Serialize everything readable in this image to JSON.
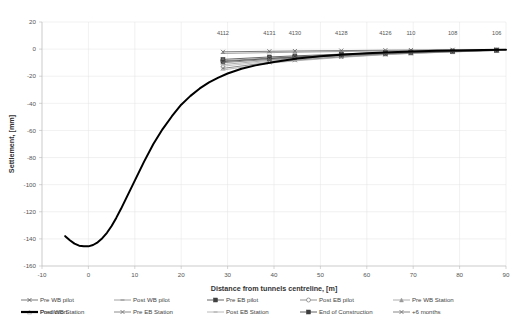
{
  "chart_data": {
    "type": "line",
    "title": "",
    "xlabel": "Distance from tunnels centreline, [m]",
    "ylabel": "Settlement, [mm]",
    "xlim": [
      -10,
      90
    ],
    "ylim": [
      -160,
      20
    ],
    "xticks": [
      -10,
      0,
      10,
      20,
      30,
      40,
      50,
      60,
      70,
      80,
      90
    ],
    "yticks": [
      20,
      0,
      -20,
      -40,
      -60,
      -80,
      -100,
      -120,
      -140,
      -160
    ],
    "grid": true,
    "legend_position": "bottom",
    "point_labels": [
      {
        "text": "4112",
        "x": 29.0
      },
      {
        "text": "4131",
        "x": 39.0
      },
      {
        "text": "4130",
        "x": 44.5
      },
      {
        "text": "4128",
        "x": 54.5
      },
      {
        "text": "4126",
        "x": 64.0
      },
      {
        "text": "110",
        "x": 69.5
      },
      {
        "text": "108",
        "x": 78.5
      },
      {
        "text": "106",
        "x": 88.0
      }
    ],
    "series": [
      {
        "name": "Pre WB pilot",
        "color": "#595959",
        "marker": "cross",
        "x": [
          29.0,
          39.0,
          44.5,
          54.5,
          64.0,
          69.5,
          78.5,
          88.0
        ],
        "values": [
          -2.0,
          -1.6,
          -1.4,
          -1.1,
          -0.8,
          -0.7,
          -0.5,
          -0.3
        ]
      },
      {
        "name": "Post WB pilot",
        "color": "#8c8c8c",
        "marker": "dash",
        "x": [
          29.0,
          39.0,
          44.5,
          54.5,
          64.0,
          69.5,
          78.5,
          88.0
        ],
        "values": [
          -3.2,
          -2.6,
          -2.3,
          -1.8,
          -1.3,
          -1.1,
          -0.8,
          -0.4
        ]
      },
      {
        "name": "Pre EB pilot",
        "color": "#404040",
        "marker": "square",
        "x": [
          29.0,
          39.0,
          44.5,
          54.5,
          64.0,
          69.5,
          78.5,
          88.0
        ],
        "values": [
          -7.6,
          -5.8,
          -5.0,
          -3.7,
          -2.6,
          -2.1,
          -1.4,
          -0.7
        ]
      },
      {
        "name": "Post EB pilot",
        "color": "#7a7a7a",
        "marker": "circle-open",
        "x": [
          29.0,
          39.0,
          44.5,
          54.5,
          64.0,
          69.5,
          78.5,
          88.0
        ],
        "values": [
          -8.6,
          -6.6,
          -5.7,
          -4.2,
          -3.0,
          -2.4,
          -1.6,
          -0.8
        ]
      },
      {
        "name": "Pre WB Station",
        "color": "#9a9a9a",
        "marker": "tri",
        "x": [
          29.0,
          39.0,
          44.5,
          54.5,
          64.0,
          69.5,
          78.5,
          88.0
        ],
        "values": [
          -11.4,
          -8.3,
          -7.0,
          -5.0,
          -3.4,
          -2.7,
          -1.8,
          -0.9
        ]
      },
      {
        "name": "Post WB Station",
        "color": "#b5b5b5",
        "marker": "tri-open",
        "x": [
          29.0,
          39.0,
          44.5,
          54.5,
          64.0,
          69.5,
          78.5,
          88.0
        ],
        "values": [
          -12.6,
          -9.0,
          -7.6,
          -5.4,
          -3.7,
          -2.9,
          -1.9,
          -0.9
        ]
      },
      {
        "name": "Pre EB Station",
        "color": "#6e6e6e",
        "marker": "cross",
        "x": [
          29.0,
          39.0,
          44.5,
          54.5,
          64.0,
          69.5,
          78.5,
          88.0
        ],
        "values": [
          -14.2,
          -9.8,
          -8.2,
          -5.8,
          -3.9,
          -3.1,
          -2.0,
          -1.0
        ]
      },
      {
        "name": "Post EB Station",
        "color": "#a8a8a8",
        "marker": "dash",
        "x": [
          29.0,
          39.0,
          44.5,
          54.5,
          64.0,
          69.5,
          78.5,
          88.0
        ],
        "values": [
          -15.4,
          -10.4,
          -8.7,
          -6.1,
          -4.1,
          -3.2,
          -2.1,
          -1.0
        ]
      },
      {
        "name": "End of Construction",
        "color": "#3d3d3d",
        "marker": "square",
        "x": [
          29.0,
          39.0,
          44.5,
          54.5,
          64.0,
          69.5,
          78.5,
          88.0
        ],
        "values": [
          -9.2,
          -7.0,
          -6.0,
          -4.4,
          -3.1,
          -2.5,
          -1.6,
          -0.8
        ]
      },
      {
        "name": "+6 months",
        "color": "#6b6b6b",
        "marker": "cross",
        "x": [
          29.0,
          39.0,
          44.5,
          54.5,
          64.0,
          69.5,
          78.5,
          88.0
        ],
        "values": [
          -10.0,
          -7.6,
          -6.5,
          -4.7,
          -3.3,
          -2.6,
          -1.7,
          -0.8
        ]
      },
      {
        "name": "Prediction",
        "color": "#000000",
        "marker": "none",
        "width": 2.0,
        "x": [
          -5,
          -4,
          -3,
          -2,
          -1,
          0,
          1,
          2,
          3,
          4,
          5,
          6,
          7,
          8,
          9,
          10,
          12,
          14,
          16,
          18,
          20,
          22,
          24,
          26,
          28,
          30,
          33,
          36,
          40,
          45,
          50,
          55,
          60,
          65,
          70,
          75,
          80,
          85,
          90
        ],
        "values": [
          -138,
          -141,
          -143.5,
          -145,
          -145.5,
          -145.5,
          -144.5,
          -142.5,
          -139.5,
          -135.5,
          -130.5,
          -124.5,
          -118,
          -111,
          -104,
          -97,
          -83,
          -70,
          -59,
          -49.5,
          -41,
          -34.5,
          -29,
          -24.5,
          -21,
          -18,
          -14.5,
          -12,
          -9.5,
          -7,
          -5.2,
          -4,
          -3,
          -2.3,
          -1.8,
          -1.3,
          -1,
          -0.7,
          -0.4
        ]
      }
    ],
    "legend": [
      {
        "label": "Pre WB pilot",
        "color": "#595959",
        "marker": "cross"
      },
      {
        "label": "Post WB pilot",
        "color": "#8c8c8c",
        "marker": "dash"
      },
      {
        "label": "Pre EB pilot",
        "color": "#404040",
        "marker": "square"
      },
      {
        "label": "Post EB pilot",
        "color": "#7a7a7a",
        "marker": "circle-open"
      },
      {
        "label": "Pre WB Station",
        "color": "#9a9a9a",
        "marker": "tri"
      },
      {
        "label": "Post WB Station",
        "color": "#b5b5b5",
        "marker": "tri-open"
      },
      {
        "label": "Pre EB Station",
        "color": "#6e6e6e",
        "marker": "cross"
      },
      {
        "label": "Post EB Station",
        "color": "#a8a8a8",
        "marker": "dash"
      },
      {
        "label": "End of Construction",
        "color": "#3d3d3d",
        "marker": "square"
      },
      {
        "label": "+6 months",
        "color": "#6b6b6b",
        "marker": "cross"
      },
      {
        "label": "Prediction",
        "color": "#000000",
        "marker": "thickline"
      }
    ]
  }
}
